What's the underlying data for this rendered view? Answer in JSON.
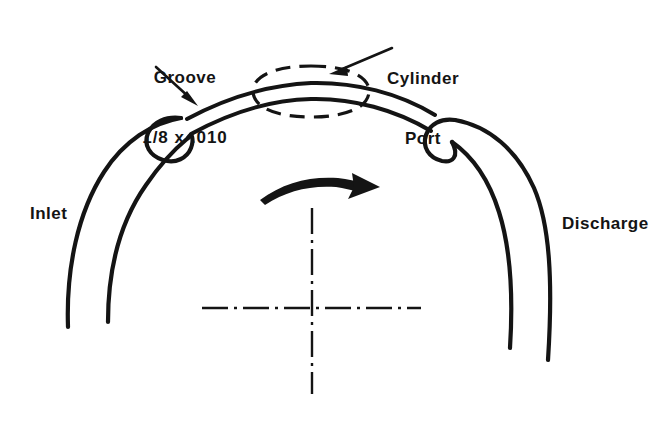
{
  "figure": {
    "background_color": "#ffffff",
    "ink_color": "#141414"
  },
  "labels": {
    "groove": {
      "line1": "Groove",
      "line2": "1/8 x .010"
    },
    "cylinder_port": {
      "line1": "Cylinder",
      "line2": "Port"
    },
    "inlet": "Inlet",
    "discharge": "Discharge"
  },
  "annotations": {
    "rotation_arrow": "rotation-direction-arrow",
    "groove_leader": "groove-leader-arrow",
    "cylinder_port_leader": "cylinder-port-leader-arrow",
    "centerline": "center-line-crosshair",
    "cylinder_port_outline": "cylinder-port-dashed-outline"
  }
}
